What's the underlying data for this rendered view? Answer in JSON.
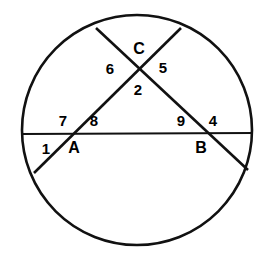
{
  "figure": {
    "kind": "circle-geometry-diagram",
    "width": 269,
    "height": 253,
    "background_color": "#ffffff",
    "stroke_color": "#111111"
  },
  "circle": {
    "name": "circle-outline",
    "cx": 137,
    "cy": 130,
    "r": 115,
    "stroke_width": 2.6
  },
  "chords": [
    {
      "name": "chord-horizontal",
      "label": "horizontal chord",
      "x1": 22,
      "y1": 134,
      "x2": 253,
      "y2": 133,
      "stroke_width": 2.2
    },
    {
      "name": "chord-upper-left-to-lower-right",
      "label": "chord from upper-left arc through C and B to lower-right arc",
      "x1": 96,
      "y1": 28,
      "x2": 248,
      "y2": 170,
      "stroke_width": 2.6
    },
    {
      "name": "chord-upper-right-to-lower-left",
      "label": "chord from upper-right arc through C and A to lower-left arc",
      "x1": 181,
      "y1": 28,
      "x2": 34,
      "y2": 173,
      "stroke_width": 2.6
    }
  ],
  "points": [
    {
      "name": "point-c",
      "label": "C",
      "x": 139,
      "y": 49
    },
    {
      "name": "point-a",
      "label": "A",
      "x": 74,
      "y": 148
    },
    {
      "name": "point-b",
      "label": "B",
      "x": 201,
      "y": 148
    }
  ],
  "angle_labels": [
    {
      "name": "angle-label-6",
      "label": "6",
      "x": 110,
      "y": 68
    },
    {
      "name": "angle-label-5",
      "label": "5",
      "x": 163,
      "y": 67
    },
    {
      "name": "angle-label-2",
      "label": "2",
      "x": 138,
      "y": 89
    },
    {
      "name": "angle-label-7",
      "label": "7",
      "x": 63,
      "y": 120
    },
    {
      "name": "angle-label-8",
      "label": "8",
      "x": 94,
      "y": 120
    },
    {
      "name": "angle-label-9",
      "label": "9",
      "x": 181,
      "y": 120
    },
    {
      "name": "angle-label-4",
      "label": "4",
      "x": 213,
      "y": 120
    },
    {
      "name": "angle-label-1",
      "label": "1",
      "x": 46,
      "y": 148
    }
  ]
}
